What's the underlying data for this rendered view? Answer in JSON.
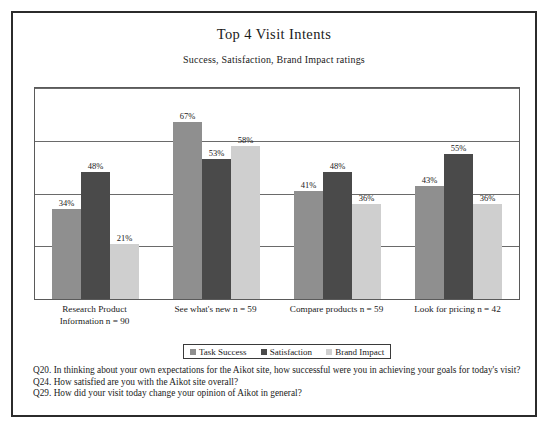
{
  "figure": {
    "title": "Top 4 Visit Intents",
    "subtitle": "Success, Satisfaction, Brand Impact ratings"
  },
  "legend": {
    "items": [
      {
        "label": "Task Success",
        "color": "#8f8f8f"
      },
      {
        "label": "Satisfaction",
        "color": "#4a4a4a"
      },
      {
        "label": "Brand Impact",
        "color": "#cfcfcf"
      }
    ]
  },
  "footnotes": [
    "Q20. In thinking about your own expectations for the Aikot site, how successful were you in achieving your goals for today's visit?",
    "Q24. How satisfied are you with the Aikot site overall?",
    "Q29. How did your visit today change your opinion of Aikot in general?"
  ],
  "chart_data": {
    "type": "bar",
    "title": "Top 4 Visit Intents",
    "subtitle": "Success, Satisfaction, Brand Impact ratings",
    "xlabel": "",
    "ylabel": "",
    "ylim": [
      0,
      80
    ],
    "grid": true,
    "gridlines": [
      20,
      40,
      60,
      80
    ],
    "legend_position": "bottom",
    "value_suffix": "%",
    "categories": [
      "Research Product Information n = 90",
      "See what's new n = 59",
      "Compare products n = 59",
      "Look for pricing n = 42"
    ],
    "category_lines": [
      [
        "Research Product",
        "Information n = 90"
      ],
      [
        "See what's new n = 59"
      ],
      [
        "Compare products n = 59"
      ],
      [
        "Look for pricing n = 42"
      ]
    ],
    "series": [
      {
        "name": "Task Success",
        "color": "#8f8f8f",
        "values": [
          34,
          67,
          41,
          43
        ],
        "labels": [
          "34%",
          "67%",
          "41%",
          "43%"
        ]
      },
      {
        "name": "Satisfaction",
        "color": "#4a4a4a",
        "values": [
          48,
          53,
          48,
          55
        ],
        "labels": [
          "48%",
          "53%",
          "48%",
          "55%"
        ]
      },
      {
        "name": "Brand Impact",
        "color": "#cfcfcf",
        "values": [
          21,
          58,
          36,
          36
        ],
        "labels": [
          "21%",
          "58%",
          "36%",
          "36%"
        ]
      }
    ]
  }
}
